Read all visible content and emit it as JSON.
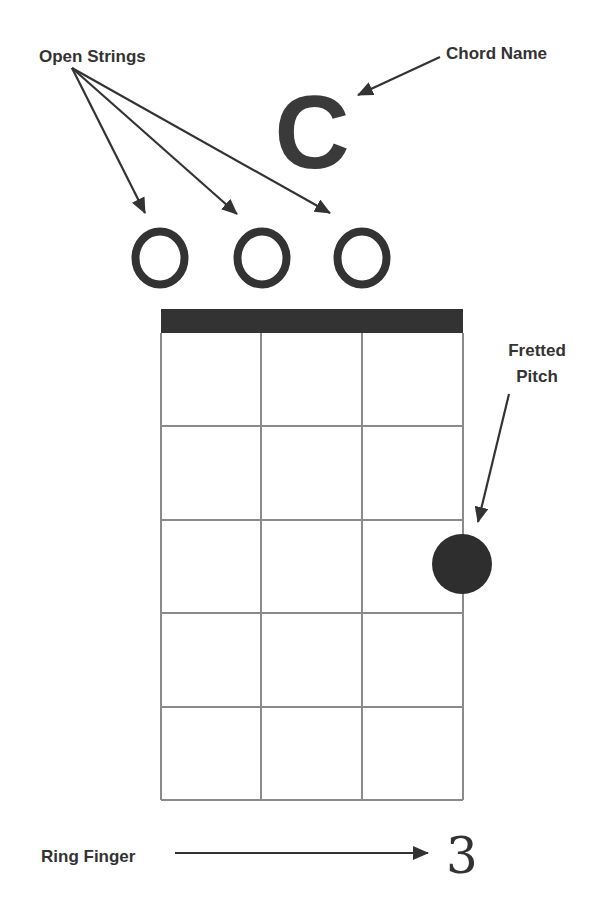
{
  "diagram": {
    "type": "ukulele-chord-diagram",
    "chord_name": "C",
    "labels": {
      "open_strings": "Open Strings",
      "chord_name": "Chord Name",
      "fretted_pitch_line1": "Fretted",
      "fretted_pitch_line2": "Pitch",
      "ring_finger": "Ring Finger"
    },
    "open_string_markers": [
      "O",
      "O",
      "O"
    ],
    "strings": 4,
    "frets_shown": 5,
    "fretted_notes": [
      {
        "string": 4,
        "fret": 3,
        "finger": "3"
      }
    ],
    "finger_number": "3",
    "colors": {
      "ink": "#333333",
      "grid": "#888888",
      "dot": "#2e2e2e",
      "background": "#ffffff"
    }
  }
}
